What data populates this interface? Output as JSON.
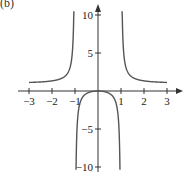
{
  "panel_label": "(b)",
  "chart_data": {
    "type": "line",
    "title": "",
    "function": "y = x^2/(x^2 - 1)",
    "xlabel": "",
    "ylabel": "y",
    "xlim": [
      -3,
      3
    ],
    "ylim": [
      -10,
      10
    ],
    "x_ticks": [
      -3,
      -2,
      -1,
      1,
      2,
      3
    ],
    "x_tick_labels": [
      "−3",
      "−2",
      "−1",
      "1",
      "2",
      "3"
    ],
    "y_ticks": [
      10,
      5,
      -5,
      -10
    ],
    "y_tick_labels": [
      "10",
      "5",
      "−5",
      "−10"
    ],
    "grid": false,
    "legend": null,
    "asymptotes": {
      "vertical": [
        -1,
        1
      ],
      "horizontal": [
        1
      ]
    },
    "series": [
      {
        "name": "left branch",
        "x": [
          -3,
          -2.5,
          -2,
          -1.5,
          -1.2,
          -1.1,
          -1.05
        ],
        "values": [
          1.125,
          1.19,
          1.333,
          1.8,
          3.27,
          5.76,
          10.76
        ]
      },
      {
        "name": "middle branch",
        "x": [
          -0.95,
          -0.9,
          -0.7,
          -0.5,
          0,
          0.5,
          0.7,
          0.9,
          0.95
        ],
        "values": [
          -9.26,
          -4.26,
          -0.96,
          -0.333,
          0,
          -0.333,
          -0.96,
          -4.26,
          -9.26
        ]
      },
      {
        "name": "right branch",
        "x": [
          1.05,
          1.1,
          1.2,
          1.5,
          2,
          2.5,
          3
        ],
        "values": [
          10.76,
          5.76,
          3.27,
          1.8,
          1.333,
          1.19,
          1.125
        ]
      }
    ],
    "colors": {
      "curve": "#555555",
      "axis": "#333333"
    }
  }
}
